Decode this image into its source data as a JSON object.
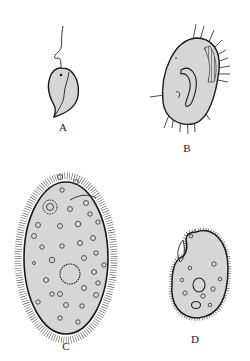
{
  "figure": {
    "panels": [
      {
        "id": "A",
        "label": "A",
        "description": "flagellate with single flagellum"
      },
      {
        "id": "B",
        "label": "B",
        "description": "hypotrich ciliate with cirri"
      },
      {
        "id": "C",
        "label": "C",
        "description": "large oval ciliate with uniform cilia and vacuoles"
      },
      {
        "id": "D",
        "label": "D",
        "description": "small kidney-shaped ciliate with oral groove"
      }
    ],
    "colors": {
      "background": "#ffffff",
      "cell_fill": "#d6d6d6",
      "outline": "#1a1a1a"
    }
  }
}
